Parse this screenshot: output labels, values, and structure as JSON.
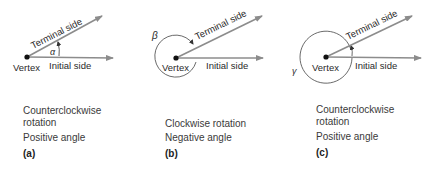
{
  "colors": {
    "arrow": "#8c8c8c",
    "line": "#444444",
    "text": "#2a2a2a"
  },
  "panels": [
    {
      "id": "a",
      "angle_symbol": "α",
      "vertex_label": "Vertex",
      "terminal_label": "Terminal side",
      "initial_label": "Initial side",
      "caption_rotation": "Counterclockwise rotation",
      "caption_rotation_line1": "Counterclockwise",
      "caption_rotation_line2": "rotation",
      "caption_sign": "Positive angle",
      "tag": "(a)"
    },
    {
      "id": "b",
      "angle_symbol": "β",
      "vertex_label": "Vertex",
      "terminal_label": "Terminal side",
      "initial_label": "Initial side",
      "caption_rotation": "Clockwise rotation",
      "caption_sign": "Negative angle",
      "tag": "(b)"
    },
    {
      "id": "c",
      "angle_symbol": "γ",
      "vertex_label": "Vertex",
      "terminal_label": "Terminal side",
      "initial_label": "Initial side",
      "caption_rotation": "Counterclockwise rotation",
      "caption_rotation_line1": "Counterclockwise",
      "caption_rotation_line2": "rotation",
      "caption_sign": "Positive angle",
      "tag": "(c)"
    }
  ]
}
